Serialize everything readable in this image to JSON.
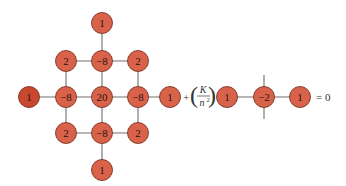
{
  "diagram": {
    "title": "",
    "colors": {
      "node_fill": "#d9634a",
      "node_fill_dark": "#c8472f",
      "node_stroke": "#7a3423",
      "edge": "#6e6e6e"
    },
    "stencil_left": {
      "nodes": [
        {
          "id": "top",
          "label": "1"
        },
        {
          "id": "r1c1",
          "label": "2"
        },
        {
          "id": "r1c2",
          "label": "−8"
        },
        {
          "id": "r1c3",
          "label": "2"
        },
        {
          "id": "left",
          "label": "1"
        },
        {
          "id": "r2c1",
          "label": "−8"
        },
        {
          "id": "center",
          "label": "20"
        },
        {
          "id": "r2c3",
          "label": "−8"
        },
        {
          "id": "right",
          "label": "1"
        },
        {
          "id": "r3c1",
          "label": "2"
        },
        {
          "id": "r3c2",
          "label": "−8"
        },
        {
          "id": "r3c3",
          "label": "2"
        },
        {
          "id": "bottom",
          "label": "1"
        }
      ]
    },
    "operator": {
      "plus": "+",
      "numerator": "K",
      "denominator": "n",
      "exponent": "2",
      "open_paren": "(",
      "close_paren": ")"
    },
    "stencil_right": {
      "nodes": [
        {
          "id": "a",
          "label": "1"
        },
        {
          "id": "b",
          "label": "−2"
        },
        {
          "id": "c",
          "label": "1"
        }
      ]
    },
    "equals": "= 0"
  }
}
